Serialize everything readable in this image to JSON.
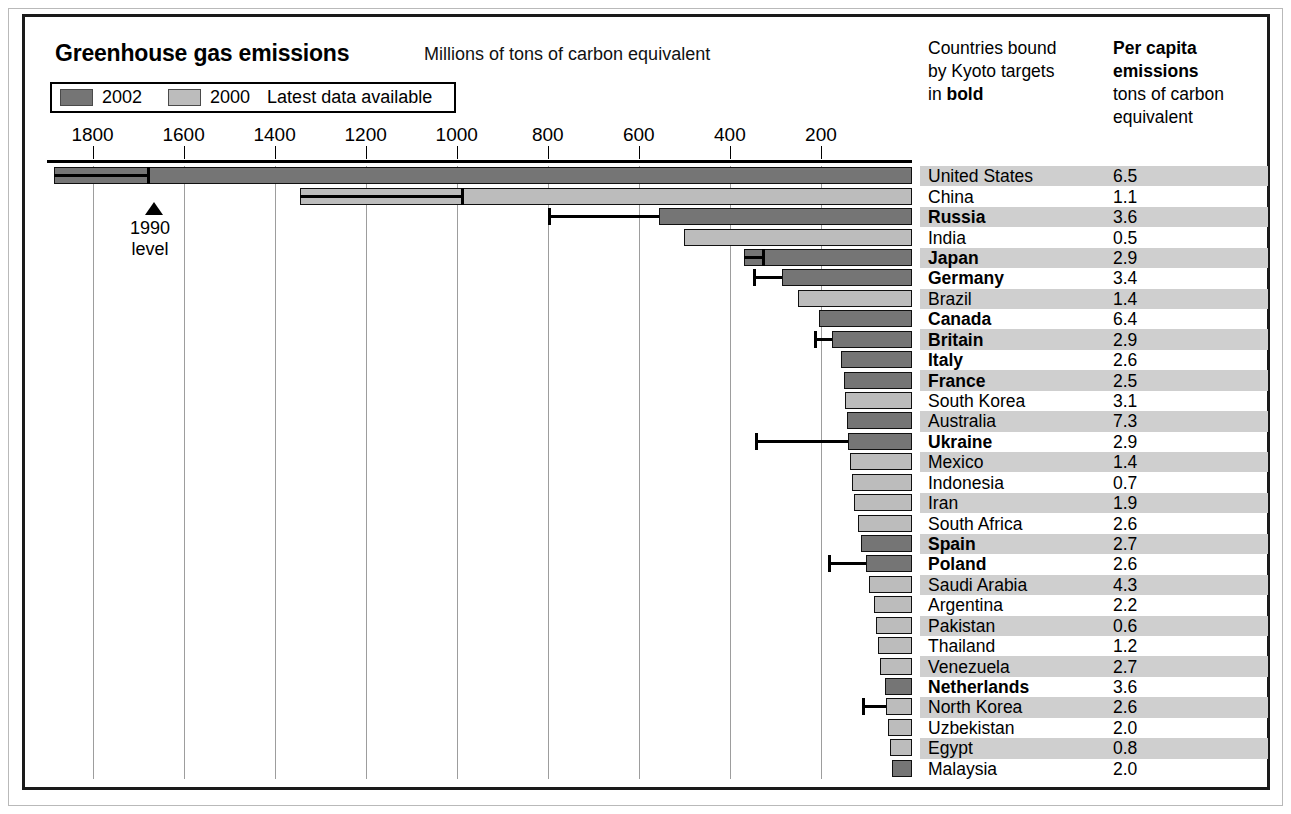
{
  "frame": {
    "accent_dark": "#757575",
    "accent_light": "#bcbcbc",
    "border": "#1a1a1a",
    "row_shade": "#cfcfcf"
  },
  "header": {
    "title": "Greenhouse gas emissions",
    "subtitle": "Millions of tons of carbon equivalent"
  },
  "legend": {
    "item_2002": "2002",
    "item_2000": "2000",
    "note": "Latest data available"
  },
  "right_header": {
    "kyoto_line1": "Countries bound",
    "kyoto_line2": "by Kyoto targets",
    "kyoto_line3_prefix": "in ",
    "kyoto_line3_bold": "bold",
    "percap_line1": "Per capita",
    "percap_line2": "emissions",
    "percap_line3": "tons of carbon",
    "percap_line4": "equivalent"
  },
  "annotation": {
    "level_label_line1": "1990",
    "level_label_line2": "level",
    "level_value": 1680
  },
  "table_headers": {
    "country": "Country",
    "per_capita": "Per capita emissions"
  },
  "chart_data": {
    "type": "bar",
    "orientation": "horizontal-right-to-left",
    "title": "Greenhouse gas emissions",
    "subtitle": "Millions of tons of carbon equivalent",
    "xlabel": "Millions of tons of carbon equivalent",
    "ylabel": "",
    "xlim": [
      0,
      1900
    ],
    "axis_direction": "reversed",
    "ticks": [
      1800,
      1600,
      1400,
      1200,
      1000,
      800,
      600,
      400,
      200
    ],
    "grid": true,
    "legend": [
      "2002",
      "2000"
    ],
    "legend_position": "top-left",
    "series_note": "Each country bar is colored by the year of its latest available data (2002 = dark, 2000 = light). Black horizontal line with end cap marks the country's 1990 emissions level.",
    "categories": [
      "United States",
      "China",
      "Russia",
      "India",
      "Japan",
      "Germany",
      "Brazil",
      "Canada",
      "Britain",
      "Italy",
      "France",
      "South Korea",
      "Australia",
      "Ukraine",
      "Mexico",
      "Indonesia",
      "Iran",
      "South Africa",
      "Spain",
      "Poland",
      "Saudi Arabia",
      "Argentina",
      "Pakistan",
      "Thailand",
      "Venezuela",
      "Netherlands",
      "North Korea",
      "Uzbekistan",
      "Egypt",
      "Malaysia"
    ],
    "rows": [
      {
        "country": "United States",
        "emissions": 1885,
        "year": 2002,
        "kyoto": false,
        "per_capita": "6.5",
        "level_1990": 1680
      },
      {
        "country": "China",
        "emissions": 1345,
        "year": 2000,
        "kyoto": false,
        "per_capita": "1.1",
        "level_1990": 990
      },
      {
        "country": "Russia",
        "emissions": 555,
        "year": 2002,
        "kyoto": true,
        "per_capita": "3.6",
        "level_1990": 800
      },
      {
        "country": "India",
        "emissions": 500,
        "year": 2000,
        "kyoto": false,
        "per_capita": "0.5",
        "level_1990": null
      },
      {
        "country": "Japan",
        "emissions": 370,
        "year": 2002,
        "kyoto": true,
        "per_capita": "2.9",
        "level_1990": 330
      },
      {
        "country": "Germany",
        "emissions": 285,
        "year": 2002,
        "kyoto": true,
        "per_capita": "3.4",
        "level_1990": 350
      },
      {
        "country": "Brazil",
        "emissions": 250,
        "year": 2000,
        "kyoto": false,
        "per_capita": "1.4",
        "level_1990": null
      },
      {
        "country": "Canada",
        "emissions": 205,
        "year": 2002,
        "kyoto": true,
        "per_capita": "6.4",
        "level_1990": null
      },
      {
        "country": "Britain",
        "emissions": 175,
        "year": 2002,
        "kyoto": true,
        "per_capita": "2.9",
        "level_1990": 215
      },
      {
        "country": "Italy",
        "emissions": 155,
        "year": 2002,
        "kyoto": true,
        "per_capita": "2.6",
        "level_1990": null
      },
      {
        "country": "France",
        "emissions": 150,
        "year": 2002,
        "kyoto": true,
        "per_capita": "2.5",
        "level_1990": null
      },
      {
        "country": "South Korea",
        "emissions": 148,
        "year": 2000,
        "kyoto": false,
        "per_capita": "3.1",
        "level_1990": null
      },
      {
        "country": "Australia",
        "emissions": 143,
        "year": 2002,
        "kyoto": false,
        "per_capita": "7.3",
        "level_1990": null
      },
      {
        "country": "Ukraine",
        "emissions": 140,
        "year": 2002,
        "kyoto": true,
        "per_capita": "2.9",
        "level_1990": 345
      },
      {
        "country": "Mexico",
        "emissions": 137,
        "year": 2000,
        "kyoto": false,
        "per_capita": "1.4",
        "level_1990": null
      },
      {
        "country": "Indonesia",
        "emissions": 132,
        "year": 2000,
        "kyoto": false,
        "per_capita": "0.7",
        "level_1990": null
      },
      {
        "country": "Iran",
        "emissions": 127,
        "year": 2000,
        "kyoto": false,
        "per_capita": "1.9",
        "level_1990": null
      },
      {
        "country": "South Africa",
        "emissions": 118,
        "year": 2000,
        "kyoto": false,
        "per_capita": "2.6",
        "level_1990": null
      },
      {
        "country": "Spain",
        "emissions": 112,
        "year": 2002,
        "kyoto": true,
        "per_capita": "2.7",
        "level_1990": null
      },
      {
        "country": "Poland",
        "emissions": 100,
        "year": 2002,
        "kyoto": true,
        "per_capita": "2.6",
        "level_1990": 185
      },
      {
        "country": "Saudi Arabia",
        "emissions": 95,
        "year": 2000,
        "kyoto": false,
        "per_capita": "4.3",
        "level_1990": null
      },
      {
        "country": "Argentina",
        "emissions": 83,
        "year": 2000,
        "kyoto": false,
        "per_capita": "2.2",
        "level_1990": null
      },
      {
        "country": "Pakistan",
        "emissions": 80,
        "year": 2000,
        "kyoto": false,
        "per_capita": "0.6",
        "level_1990": null
      },
      {
        "country": "Thailand",
        "emissions": 75,
        "year": 2000,
        "kyoto": false,
        "per_capita": "1.2",
        "level_1990": null
      },
      {
        "country": "Venezuela",
        "emissions": 70,
        "year": 2000,
        "kyoto": false,
        "per_capita": "2.7",
        "level_1990": null
      },
      {
        "country": "Netherlands",
        "emissions": 60,
        "year": 2002,
        "kyoto": true,
        "per_capita": "3.6",
        "level_1990": null
      },
      {
        "country": "North Korea",
        "emissions": 58,
        "year": 2000,
        "kyoto": false,
        "per_capita": "2.6",
        "level_1990": 110
      },
      {
        "country": "Uzbekistan",
        "emissions": 52,
        "year": 2000,
        "kyoto": false,
        "per_capita": "2.0",
        "level_1990": null
      },
      {
        "country": "Egypt",
        "emissions": 48,
        "year": 2000,
        "kyoto": false,
        "per_capita": "0.8",
        "level_1990": null
      },
      {
        "country": "Malaysia",
        "emissions": 45,
        "year": 2002,
        "kyoto": false,
        "per_capita": "2.0",
        "level_1990": null
      }
    ]
  }
}
